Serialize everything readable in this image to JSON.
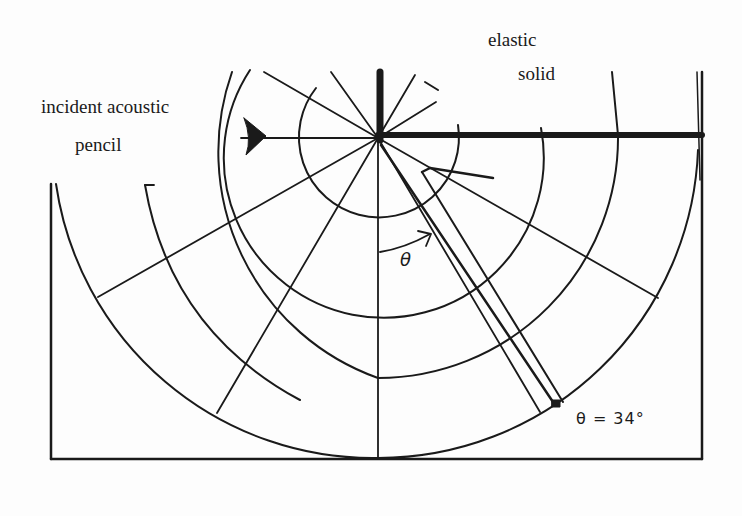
{
  "labels": {
    "incident_line1": "incident acoustic",
    "incident_line2": "pencil",
    "medium_line1": "elastic",
    "medium_line2": "solid",
    "theta_symbol": "θ",
    "angle_annotation": "θ = 34°"
  },
  "diagram": {
    "origin": [
      378,
      138
    ],
    "interface_y": 135,
    "arc_radii": [
      80,
      160,
      240,
      320
    ],
    "beam_angle_deg": 34,
    "stroke_color": "#1a1a1a",
    "background": "#fdfdfd"
  }
}
